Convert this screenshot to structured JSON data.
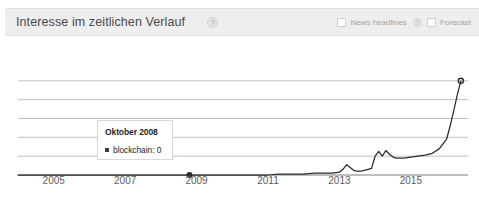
{
  "header": {
    "title": "Interesse im zeitlichen Verlauf",
    "help_icon": "question-mark-icon",
    "help_glyph": "?",
    "controls": [
      {
        "label": "News headlines",
        "checked": false,
        "has_help": true,
        "help_glyph": "?"
      },
      {
        "label": "Forecast",
        "checked": false,
        "has_help": false,
        "help_glyph": ""
      }
    ]
  },
  "tooltip": {
    "title": "Oktober 2008",
    "series_label": "blockchain",
    "value": "0",
    "row_text": "blockchain: 0",
    "marker_color": "#3b3b3b"
  },
  "colors": {
    "header_bg": "#eeeeee",
    "grid": "#b9b9b9",
    "axis": "#7d7d7d",
    "line": "#2b2b2b",
    "text": "#5b5b5b"
  },
  "chart_data": {
    "type": "line",
    "title": "Interesse im zeitlichen Verlauf",
    "xlabel": "",
    "ylabel": "",
    "grid": true,
    "legend": "none",
    "xlim": [
      2004.0,
      2016.6
    ],
    "ylim": [
      0,
      120
    ],
    "yticks": [
      0,
      20,
      40,
      60,
      80,
      100
    ],
    "xticks": [
      2005,
      2007,
      2009,
      2011,
      2013,
      2015
    ],
    "xtick_labels": [
      "2005",
      "2007",
      "2009",
      "2011",
      "2013",
      "2015"
    ],
    "annotations": [
      {
        "kind": "axis-marker",
        "x": 2008.8,
        "y": 0,
        "label": "Oktober 2008"
      },
      {
        "kind": "endpoint-marker",
        "x": 2016.4,
        "y": 100,
        "label": ""
      }
    ],
    "series": [
      {
        "name": "blockchain",
        "color": "#2b2b2b",
        "x": [
          2004.0,
          2004.5,
          2005.0,
          2005.5,
          2006.0,
          2006.5,
          2007.0,
          2007.5,
          2008.0,
          2008.5,
          2008.8,
          2009.0,
          2009.5,
          2010.0,
          2010.5,
          2011.0,
          2011.3,
          2011.5,
          2011.8,
          2012.0,
          2012.3,
          2012.5,
          2012.8,
          2013.0,
          2013.1,
          2013.2,
          2013.3,
          2013.4,
          2013.5,
          2013.6,
          2013.7,
          2013.8,
          2013.9,
          2014.0,
          2014.1,
          2014.2,
          2014.3,
          2014.4,
          2014.5,
          2014.6,
          2014.8,
          2015.0,
          2015.2,
          2015.4,
          2015.6,
          2015.8,
          2016.0,
          2016.1,
          2016.2,
          2016.3,
          2016.4
        ],
        "y": [
          0,
          0,
          0,
          0,
          0,
          0,
          0,
          0,
          0,
          0,
          0,
          0,
          0,
          0,
          0,
          0,
          1,
          1,
          1,
          1,
          2,
          2,
          2,
          3,
          6,
          11,
          8,
          5,
          4,
          4,
          5,
          6,
          7,
          20,
          25,
          20,
          26,
          22,
          19,
          18,
          18,
          19,
          20,
          21,
          23,
          28,
          38,
          52,
          68,
          85,
          100
        ]
      }
    ]
  }
}
